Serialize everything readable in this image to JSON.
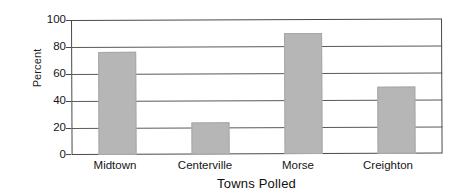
{
  "chart_data": {
    "type": "bar",
    "title": "",
    "categories": [
      "Midtown",
      "Centerville",
      "Morse",
      "Creighton"
    ],
    "values": [
      76,
      24,
      90,
      50
    ],
    "series": [
      {
        "name": "Percent",
        "values": [
          76,
          24,
          90,
          50
        ]
      }
    ],
    "xlabel": "Towns Polled",
    "ylabel": "Percent",
    "ylim": [
      0,
      100
    ],
    "yticks": [
      0,
      20,
      40,
      60,
      80,
      100
    ],
    "ytick_labels": [
      "0",
      "20",
      "40",
      "60",
      "80",
      "100"
    ],
    "grid": true,
    "grid_axis": "y",
    "legend": false,
    "bar_color": "#b6b6b6",
    "axis_color": "#4a4a4a",
    "background_color": "#ffffff"
  },
  "axes": {
    "y_title": "Percent",
    "x_title": "Towns Polled"
  },
  "ticks": {
    "y": [
      "100",
      "80",
      "60",
      "40",
      "20",
      "0"
    ]
  },
  "categories": {
    "c0": "Midtown",
    "c1": "Centerville",
    "c2": "Morse",
    "c3": "Creighton"
  }
}
